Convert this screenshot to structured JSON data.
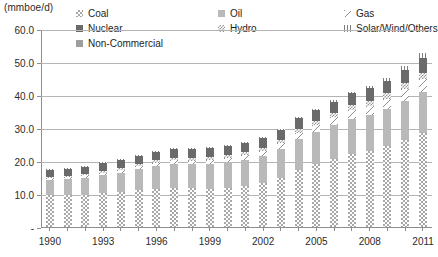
{
  "axis": {
    "unit_caption": "(mmboe/d)",
    "y_ticks": [
      "60.0",
      "50.0",
      "40.0",
      "30.0",
      "20.0",
      "10.0",
      "-"
    ],
    "x_labels": [
      "1990",
      "1993",
      "1996",
      "1999",
      "2002",
      "2005",
      "2008",
      "2011"
    ]
  },
  "legend": {
    "items": [
      {
        "label": "Coal",
        "pattern": "p-coal",
        "name": "legend-item-coal"
      },
      {
        "label": "Oil",
        "pattern": "p-oil",
        "name": "legend-item-oil"
      },
      {
        "label": "Gas",
        "pattern": "p-gas",
        "name": "legend-item-gas"
      },
      {
        "label": "Nuclear",
        "pattern": "p-nuclear",
        "name": "legend-item-nuclear"
      },
      {
        "label": "Hydro",
        "pattern": "p-hydro",
        "name": "legend-item-hydro"
      },
      {
        "label": "Solar/Wind/Others",
        "pattern": "p-solar",
        "name": "legend-item-solar-wind-others"
      },
      {
        "label": "Non-Commercial",
        "pattern": "p-noncomm",
        "name": "legend-item-non-commercial"
      }
    ]
  },
  "colors": {
    "coal": "#a8a8a8",
    "oil": "#b9b9b9",
    "gas": "#fdfdfd",
    "nuclear": "#6a6a6a",
    "hydro": "#949494",
    "solar": "#7d7d7d",
    "non_commercial": "#9e9e9e",
    "gridline": "#b4b4b4",
    "axis": "#8e8e8e",
    "text": "#2b2b2b"
  },
  "chart_data": {
    "type": "bar",
    "subtype": "stacked-vertical",
    "title": "",
    "xlabel": "",
    "ylabel": "(mmboe/d)",
    "ylim": [
      0,
      60
    ],
    "ytick_values": [
      0,
      10,
      20,
      30,
      40,
      50,
      60
    ],
    "grid": true,
    "legend_position": "top",
    "categories": [
      "1990",
      "1991",
      "1992",
      "1993",
      "1994",
      "1995",
      "1996",
      "1997",
      "1998",
      "1999",
      "2000",
      "2001",
      "2002",
      "2003",
      "2004",
      "2005",
      "2006",
      "2007",
      "2008",
      "2009",
      "2010",
      "2011"
    ],
    "series": [
      {
        "name": "Coal",
        "pattern": "p-coal",
        "values": [
          9.6,
          9.6,
          9.8,
          10.2,
          10.5,
          11.2,
          11.6,
          11.9,
          11.7,
          11.6,
          11.9,
          12.4,
          13.2,
          15.0,
          17.2,
          19.0,
          20.6,
          22.1,
          23.1,
          24.6,
          26.3,
          28.6
        ]
      },
      {
        "name": "Oil",
        "pattern": "p-oil",
        "values": [
          4.6,
          4.9,
          5.2,
          5.6,
          6.0,
          6.4,
          6.9,
          7.3,
          7.3,
          7.6,
          7.8,
          8.0,
          8.3,
          8.7,
          9.5,
          9.8,
          10.2,
          10.6,
          10.7,
          11.1,
          11.8,
          12.2
        ]
      },
      {
        "name": "Gas",
        "pattern": "p-gas",
        "values": [
          0.6,
          0.6,
          0.7,
          0.7,
          0.8,
          0.9,
          1.0,
          1.0,
          1.1,
          1.2,
          1.3,
          1.4,
          1.5,
          1.7,
          1.9,
          2.1,
          2.4,
          2.7,
          2.9,
          3.1,
          3.6,
          4.0
        ]
      },
      {
        "name": "Hydro",
        "pattern": "p-hydro",
        "values": [
          0.5,
          0.5,
          0.5,
          0.6,
          0.6,
          0.7,
          0.7,
          0.7,
          0.8,
          0.8,
          0.8,
          0.9,
          0.9,
          1.0,
          1.1,
          1.2,
          1.4,
          1.5,
          1.6,
          1.8,
          1.9,
          2.0
        ]
      },
      {
        "name": "Nuclear",
        "pattern": "p-nuclear",
        "values": [
          1.9,
          2.0,
          2.1,
          2.2,
          2.3,
          2.4,
          2.5,
          2.6,
          2.6,
          2.7,
          2.8,
          2.9,
          3.0,
          3.1,
          3.2,
          3.3,
          3.4,
          3.6,
          3.7,
          3.8,
          4.1,
          4.4
        ]
      },
      {
        "name": "Solar/Wind/Others",
        "pattern": "p-solar",
        "values": [
          0.1,
          0.1,
          0.1,
          0.1,
          0.1,
          0.1,
          0.1,
          0.2,
          0.2,
          0.2,
          0.2,
          0.2,
          0.3,
          0.3,
          0.3,
          0.4,
          0.4,
          0.5,
          0.6,
          0.8,
          1.1,
          1.4
        ]
      },
      {
        "name": "Non-Commercial",
        "pattern": "p-noncomm",
        "values": [
          1.2,
          1.2,
          1.2,
          1.2,
          1.2,
          1.2,
          1.2,
          1.2,
          1.2,
          1.2,
          1.2,
          1.2,
          1.2,
          1.2,
          1.2,
          1.2,
          1.2,
          1.2,
          1.2,
          1.2,
          1.2,
          1.2
        ]
      }
    ],
    "totals": [
      18.5,
      18.9,
      19.6,
      20.6,
      21.5,
      22.9,
      24.0,
      24.9,
      24.9,
      25.3,
      26.0,
      27.0,
      28.4,
      31.0,
      34.4,
      37.0,
      39.6,
      42.2,
      43.8,
      46.4,
      50.0,
      53.8
    ]
  }
}
